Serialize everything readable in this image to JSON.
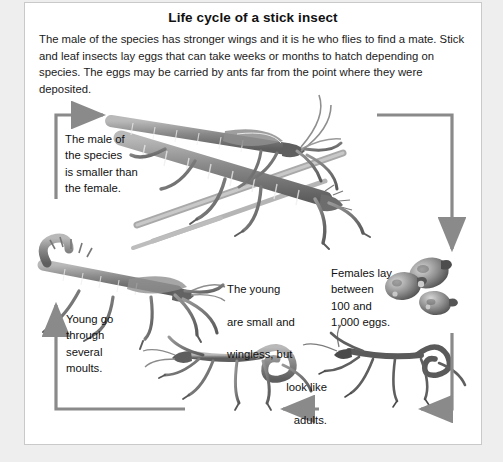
{
  "panel": {
    "title": "Life cycle of a stick insect",
    "intro": "The male of the species has stronger wings and it is he who flies to find a mate. Stick and leaf insects lay eggs that can take weeks or months to hatch depending on species. The eggs may be carried by ants far from the point where they were deposited."
  },
  "labels": {
    "male_size": "The male of\nthe species\nis smaller than\nthe female.",
    "young_moults": "Young go\nthrough\nseveral\nmoults.",
    "young_small": {
      "line1": "The young",
      "line2": "are small and",
      "line3": "wingless, but",
      "line4": "look like",
      "line5": "adults."
    },
    "females_eggs": "Females lay\nbetween\n100 and\n1,000 eggs."
  },
  "figures": {
    "mating_pair": "mating-stick-insects-illustration",
    "adult_female": "adult-stick-insect-illustration",
    "eggs": "stick-insect-eggs-illustration",
    "nymph_left": "stick-insect-nymph-illustration",
    "nymph_right": "stick-insect-nymph-illustration"
  },
  "arrows": {
    "top_left": "arrow-right",
    "top_right": "arrow-down",
    "bottom_right": "arrow-left",
    "bottom_middle": "arrow-left",
    "bottom_left": "arrow-up"
  },
  "colors": {
    "page_background": "#eeeeee",
    "panel_background": "#ffffff",
    "panel_border": "#c9c9c9",
    "text": "#111111",
    "arrow": "#7a7a7a",
    "art_ink": "#6e6e6e"
  }
}
